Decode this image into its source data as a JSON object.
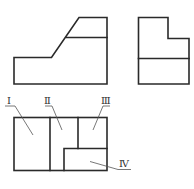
{
  "diagram": {
    "type": "orthographic-three-view",
    "views": {
      "front": {
        "name": "front-view",
        "shape": "stepped block with inclined face"
      },
      "side": {
        "name": "side-view",
        "shape": "L-shaped profile with horizontal division"
      },
      "top": {
        "name": "top-view",
        "shape": "rectangle divided into four regions"
      }
    },
    "region_labels": [
      {
        "id": "I",
        "text": "Ⅰ"
      },
      {
        "id": "II",
        "text": "Ⅱ"
      },
      {
        "id": "III",
        "text": "Ⅲ"
      },
      {
        "id": "IV",
        "text": "Ⅳ"
      }
    ],
    "colors": {
      "line": "#2a2a2a",
      "leader": "#555555",
      "background": "#ffffff"
    }
  }
}
